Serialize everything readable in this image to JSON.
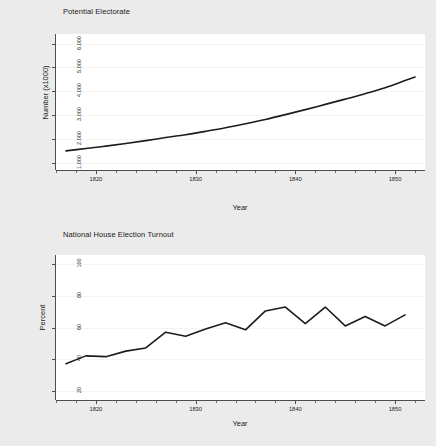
{
  "figure": {
    "background_color": "#ebebeb",
    "plot_background_color": "#ffffff",
    "line_color": "#1c1c1c",
    "gridline_color": "#f4f4f4",
    "axis_color": "#4d4d4d"
  },
  "chart_data": [
    {
      "type": "line",
      "title": "Potential Electorate",
      "xlabel": "Year",
      "ylabel": "Number (x1000)",
      "xlim": [
        1816,
        1853
      ],
      "ylim": [
        700,
        6400
      ],
      "grid": true,
      "legend": "none",
      "y_ticks": [
        1000,
        2000,
        3000,
        4000,
        5000,
        6000
      ],
      "y_tick_labels": [
        "1,000",
        "2,000",
        "3,000",
        "4,000",
        "5,000",
        "6,000"
      ],
      "x_ticks": [
        1820,
        1830,
        1840,
        1850
      ],
      "x_tick_labels": [
        "1820",
        "1830",
        "1840",
        "1850"
      ],
      "x_minor_tick_step": 2,
      "x": [
        1817,
        1819,
        1821,
        1823,
        1825,
        1827,
        1829,
        1831,
        1833,
        1835,
        1837,
        1839,
        1841,
        1843,
        1845,
        1847,
        1849,
        1851,
        1852
      ],
      "values": [
        1500,
        1600,
        1700,
        1810,
        1930,
        2060,
        2180,
        2320,
        2470,
        2640,
        2820,
        3020,
        3230,
        3450,
        3670,
        3900,
        4150,
        4450,
        4600
      ]
    },
    {
      "type": "line",
      "title": "National House Election Turnout",
      "xlabel": "Year",
      "ylabel": "Percent",
      "xlim": [
        1816,
        1853
      ],
      "ylim": [
        14,
        106
      ],
      "grid": true,
      "legend": "none",
      "y_ticks": [
        20,
        40,
        60,
        80,
        100
      ],
      "y_tick_labels": [
        "20",
        "40",
        "60",
        "80",
        "100"
      ],
      "x_ticks": [
        1820,
        1830,
        1840,
        1850
      ],
      "x_tick_labels": [
        "1820",
        "1830",
        "1840",
        "1850"
      ],
      "x_minor_tick_step": 2,
      "x": [
        1817,
        1819,
        1821,
        1823,
        1825,
        1827,
        1829,
        1831,
        1833,
        1835,
        1837,
        1839,
        1841,
        1843,
        1845,
        1847,
        1849,
        1851
      ],
      "values": [
        37,
        42,
        41.5,
        45,
        47,
        57,
        54.5,
        59,
        63,
        58.5,
        70.5,
        73,
        62.5,
        73,
        61,
        67,
        61,
        68
      ]
    }
  ]
}
